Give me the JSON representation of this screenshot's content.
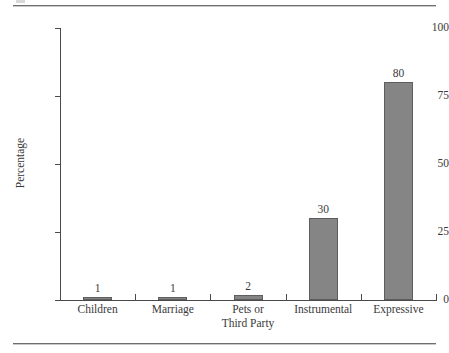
{
  "chart_data": {
    "type": "bar",
    "title": "",
    "xlabel": "",
    "ylabel": "Percentage",
    "categories": [
      "Children",
      "Marriage",
      "Pets or\nThird Party",
      "Instrumental",
      "Expressive"
    ],
    "category_labels": [
      {
        "line1": "Children",
        "line2": ""
      },
      {
        "line1": "Marriage",
        "line2": ""
      },
      {
        "line1": "Pets or",
        "line2": "Third Party"
      },
      {
        "line1": "Instrumental",
        "line2": ""
      },
      {
        "line1": "Expressive",
        "line2": ""
      }
    ],
    "values": [
      1,
      1,
      2,
      30,
      80
    ],
    "value_labels": [
      "1",
      "1",
      "2",
      "30",
      "80"
    ],
    "ylim": [
      0,
      100
    ],
    "yticks": [
      0,
      25,
      50,
      75,
      100
    ],
    "ytick_labels": [
      "0",
      "25",
      "50",
      "75",
      "100"
    ],
    "grid": false,
    "legend": null,
    "bar_color": "#858585",
    "bar_border_color": "#5e5e5e",
    "axis_color": "#4a4a4a",
    "text_color": "#3a3a3a"
  }
}
